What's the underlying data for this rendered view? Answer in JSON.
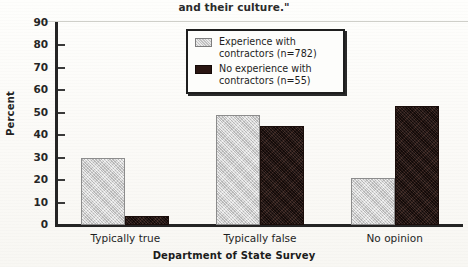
{
  "caption": {
    "text": "and their culture.\""
  },
  "chart_data": {
    "type": "bar",
    "title": "",
    "xlabel": "Department of State Survey",
    "ylabel": "Percent",
    "ylim": [
      0,
      90
    ],
    "ytick_step": 10,
    "yticks": [
      90,
      80,
      70,
      60,
      50,
      40,
      30,
      20,
      10,
      0
    ],
    "grid": false,
    "legend_position": "upper-center",
    "categories": [
      "Typically true",
      "Typically false",
      "No opinion"
    ],
    "series": [
      {
        "name": "Experience with contractors (n=782)",
        "color": "#d2d2d2",
        "values": [
          30,
          49,
          21
        ]
      },
      {
        "name": "No experience with contractors (n=55)",
        "color": "#2a1612",
        "values": [
          4,
          44,
          53
        ]
      }
    ]
  },
  "legend": {
    "items": [
      {
        "label_line1": "Experience with",
        "label_line2": "contractors (n=782)",
        "swatch": "light-gray-swatch"
      },
      {
        "label_line1": "No experience with",
        "label_line2": "contractors (n=55)",
        "swatch": "dark-brown-swatch"
      }
    ]
  }
}
